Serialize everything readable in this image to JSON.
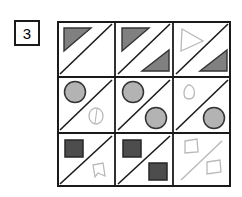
{
  "page": {
    "kind": "matrix-reasoning-puzzle",
    "background_color": "#ffffff"
  },
  "label": {
    "name": "item-number-box",
    "text": "3",
    "border_color": "#1a1a1a",
    "background_color": "#ffffff"
  },
  "matrix": {
    "rows": 3,
    "cols": 3,
    "x": 57,
    "y": 21,
    "width": 174,
    "height": 166,
    "border_color": "#1a1a1a",
    "background_color": "#ffffff",
    "diagonal_color": "#1a1a1a",
    "faint_color": "#b9b9b9",
    "cells": [
      {
        "id": "cell-r1c1",
        "row": 1,
        "col": 1,
        "diagonal": "bottom-left-to-top-right",
        "diagonal_style": "solid-dark",
        "shapes": [
          {
            "name": "filled-triangle",
            "kind": "triangle",
            "position": "upper-left",
            "fill": "#808080",
            "stroke": "#333333",
            "faint": false
          }
        ]
      },
      {
        "id": "cell-r1c2",
        "row": 1,
        "col": 2,
        "diagonal": "bottom-left-to-top-right",
        "diagonal_style": "solid-dark",
        "shapes": [
          {
            "name": "filled-triangle",
            "kind": "triangle",
            "position": "upper-left",
            "fill": "#808080",
            "stroke": "#333333",
            "faint": false
          },
          {
            "name": "filled-triangle",
            "kind": "triangle",
            "position": "lower-right",
            "fill": "#808080",
            "stroke": "#333333",
            "faint": false
          }
        ]
      },
      {
        "id": "cell-r1c3",
        "row": 1,
        "col": 3,
        "diagonal": "bottom-left-to-top-right",
        "diagonal_style": "solid-dark",
        "shapes": [
          {
            "name": "faint-outline-triangle",
            "kind": "triangle",
            "position": "upper-left",
            "fill": "none",
            "stroke": "#b9b9b9",
            "faint": true
          },
          {
            "name": "filled-triangle",
            "kind": "triangle",
            "position": "lower-right",
            "fill": "#808080",
            "stroke": "#333333",
            "faint": false
          }
        ]
      },
      {
        "id": "cell-r2c1",
        "row": 2,
        "col": 1,
        "diagonal": "bottom-left-to-top-right",
        "diagonal_style": "solid-dark",
        "shapes": [
          {
            "name": "filled-circle",
            "kind": "circle",
            "position": "upper-left",
            "fill": "#b3b3b3",
            "stroke": "#333333",
            "faint": false
          },
          {
            "name": "faint-outline-circle",
            "kind": "circle",
            "position": "lower-right",
            "fill": "none",
            "stroke": "#b9b9b9",
            "faint": true
          }
        ]
      },
      {
        "id": "cell-r2c2",
        "row": 2,
        "col": 2,
        "diagonal": "bottom-left-to-top-right",
        "diagonal_style": "solid-dark",
        "shapes": [
          {
            "name": "filled-circle",
            "kind": "circle",
            "position": "upper-left",
            "fill": "#b3b3b3",
            "stroke": "#333333",
            "faint": false
          },
          {
            "name": "filled-circle",
            "kind": "circle",
            "position": "lower-right",
            "fill": "#b3b3b3",
            "stroke": "#333333",
            "faint": false
          }
        ]
      },
      {
        "id": "cell-r2c3",
        "row": 2,
        "col": 3,
        "diagonal": "bottom-left-to-top-right",
        "diagonal_style": "solid-dark",
        "shapes": [
          {
            "name": "faint-outline-circle",
            "kind": "circle",
            "position": "upper-left",
            "fill": "none",
            "stroke": "#b9b9b9",
            "faint": true
          },
          {
            "name": "filled-circle",
            "kind": "circle",
            "position": "lower-right",
            "fill": "#b3b3b3",
            "stroke": "#333333",
            "faint": false
          }
        ]
      },
      {
        "id": "cell-r3c1",
        "row": 3,
        "col": 1,
        "diagonal": "bottom-left-to-top-right",
        "diagonal_style": "solid-dark",
        "shapes": [
          {
            "name": "filled-square",
            "kind": "square",
            "position": "upper-left",
            "fill": "#4d4d4d",
            "stroke": "#262626",
            "faint": false
          },
          {
            "name": "faint-outline-quadrilateral",
            "kind": "quadrilateral",
            "position": "lower-right",
            "fill": "none",
            "stroke": "#b9b9b9",
            "faint": true
          }
        ]
      },
      {
        "id": "cell-r3c2",
        "row": 3,
        "col": 2,
        "diagonal": "bottom-left-to-top-right",
        "diagonal_style": "solid-dark",
        "shapes": [
          {
            "name": "filled-square",
            "kind": "square",
            "position": "upper-left",
            "fill": "#4d4d4d",
            "stroke": "#262626",
            "faint": false
          },
          {
            "name": "filled-square",
            "kind": "square",
            "position": "lower-right",
            "fill": "#4d4d4d",
            "stroke": "#262626",
            "faint": false
          }
        ]
      },
      {
        "id": "cell-r3c3",
        "row": 3,
        "col": 3,
        "diagonal": "bottom-left-to-top-right",
        "diagonal_style": "faint",
        "shapes": [
          {
            "name": "faint-outline-quadrilateral",
            "kind": "quadrilateral",
            "position": "upper-left",
            "fill": "none",
            "stroke": "#b9b9b9",
            "faint": true
          },
          {
            "name": "faint-outline-quadrilateral",
            "kind": "quadrilateral",
            "position": "lower-right",
            "fill": "none",
            "stroke": "#b9b9b9",
            "faint": true
          }
        ]
      }
    ]
  }
}
